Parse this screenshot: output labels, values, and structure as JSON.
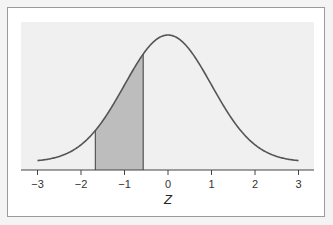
{
  "chart_data": {
    "type": "area",
    "title": "",
    "xlabel": "Z",
    "ylabel": "",
    "xlim": [
      -3,
      3
    ],
    "x_ticks": [
      -3,
      -2,
      -1,
      0,
      1,
      2,
      3
    ],
    "x_tick_labels": [
      "−3",
      "−2",
      "−1",
      "0",
      "1",
      "2",
      "3"
    ],
    "curve": "standard normal density",
    "shaded_region": {
      "from": -1.67,
      "to": -0.57
    },
    "grid": false,
    "legend": null,
    "colors": {
      "plot_bg": "#f0f0f0",
      "curve": "#555555",
      "shade": "#bdbdbd",
      "frame": "#9a9a9a"
    }
  }
}
